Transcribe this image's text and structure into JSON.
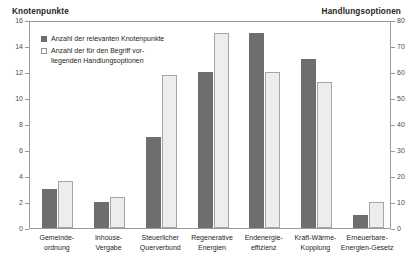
{
  "header": {
    "left_title": "Knotenpunkte",
    "right_title": "Handlungsoptionen"
  },
  "legend": {
    "position": "inside-top-left",
    "entries": [
      {
        "swatch": "dark-filled-square-icon",
        "label": "Anzahl der relevanten Knotenpunkte"
      },
      {
        "swatch": "light-outlined-square-icon",
        "label": "Anzahl der für den Begriff vor-\nliegenden Handlungsoptionen"
      }
    ]
  },
  "colors": {
    "series_dark": "#6e6e6e",
    "series_light": "#ededed",
    "series_light_border": "#a5a5a5",
    "axis": "#9a9a9a",
    "text": "#231f20"
  },
  "chart_data": {
    "type": "bar",
    "title": "",
    "subtitle": "",
    "xlabel": "",
    "ylabel": "Knotenpunkte",
    "y2label": "Handlungsoptionen",
    "grid": false,
    "legend_position": "inside-top-left",
    "categories": [
      "Gemeinde-\nordnung",
      "Inhouse-\nVergabe",
      "Steuerlicher\nQuerverbund",
      "Regenerative\nEnergien",
      "Endenergie-\neffizienz",
      "Kraft-Wärme-\nKopplung",
      "Erneuerbare-\nEnergien-Gesetz"
    ],
    "ylim": [
      0,
      16
    ],
    "yticks": [
      0,
      2,
      4,
      6,
      8,
      10,
      12,
      14,
      16
    ],
    "ytick_labels": [
      "0",
      "2",
      "4",
      "6",
      "8",
      "10",
      "12",
      "14",
      "16"
    ],
    "y2lim": [
      0,
      80
    ],
    "y2ticks": [
      0,
      10,
      20,
      30,
      40,
      50,
      60,
      70,
      80
    ],
    "y2tick_labels": [
      "0",
      "10",
      "20",
      "30",
      "40",
      "50",
      "60",
      "70",
      "80"
    ],
    "series": [
      {
        "name": "Anzahl der relevanten Knotenpunkte",
        "axis": "left",
        "values": [
          3,
          2,
          7,
          12,
          15,
          13,
          1
        ]
      },
      {
        "name": "Anzahl der für den Begriff vorliegenden Handlungsoptionen",
        "axis": "right",
        "values": [
          18,
          12,
          59,
          75,
          60,
          56,
          10
        ]
      }
    ]
  }
}
